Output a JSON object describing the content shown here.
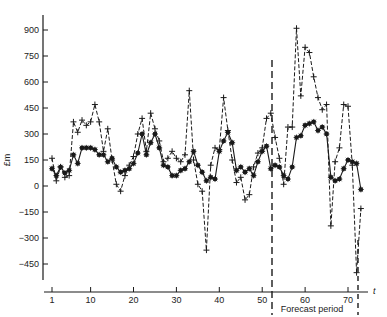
{
  "chart_data": {
    "type": "line",
    "title": "",
    "xlabel": "t",
    "ylabel": "£m",
    "ylim": [
      -520,
      960
    ],
    "xlim": [
      0,
      75
    ],
    "grid": false,
    "x_ticks": [
      1,
      10,
      20,
      30,
      40,
      50,
      60,
      70
    ],
    "y_ticks": [
      -450,
      -300,
      -150,
      0,
      150,
      300,
      450,
      600,
      750,
      900
    ],
    "annotations": [
      {
        "text": "Forecast period",
        "x": 62,
        "position": "below-axis"
      }
    ],
    "forecast_start": 53,
    "forecast_end": 73,
    "series": [
      {
        "name": "series-solid-asterisk",
        "marker": "*",
        "line": "solid",
        "x": [
          1,
          2,
          3,
          4,
          5,
          6,
          7,
          8,
          9,
          10,
          11,
          12,
          13,
          14,
          15,
          16,
          17,
          18,
          19,
          20,
          21,
          22,
          23,
          24,
          25,
          26,
          27,
          28,
          29,
          30,
          31,
          32,
          33,
          34,
          35,
          36,
          37,
          38,
          39,
          40,
          41,
          42,
          43,
          44,
          45,
          46,
          47,
          48,
          49,
          50,
          51,
          52,
          53,
          54,
          55,
          56,
          57,
          58,
          59,
          60,
          61,
          62,
          63,
          64,
          65,
          66,
          67,
          68,
          69,
          70,
          71,
          72,
          73
        ],
        "values": [
          100,
          60,
          110,
          75,
          90,
          180,
          130,
          220,
          220,
          220,
          210,
          180,
          180,
          140,
          160,
          110,
          80,
          90,
          100,
          130,
          190,
          300,
          180,
          250,
          300,
          220,
          120,
          110,
          60,
          60,
          90,
          100,
          140,
          200,
          120,
          80,
          30,
          50,
          40,
          200,
          260,
          310,
          250,
          90,
          110,
          80,
          100,
          60,
          140,
          200,
          230,
          100,
          120,
          110,
          60,
          40,
          110,
          280,
          290,
          350,
          360,
          370,
          320,
          340,
          300,
          50,
          30,
          40,
          100,
          150,
          140,
          130,
          -20
        ],
        "dashed_values_note": "solid line with asterisk markers"
      },
      {
        "name": "series-dashed-plus",
        "marker": "+",
        "line": "dashed",
        "x": [
          1,
          2,
          3,
          4,
          5,
          6,
          7,
          8,
          9,
          10,
          11,
          12,
          13,
          14,
          15,
          16,
          17,
          18,
          19,
          20,
          21,
          22,
          23,
          24,
          25,
          26,
          27,
          28,
          29,
          30,
          31,
          32,
          33,
          34,
          35,
          36,
          37,
          38,
          39,
          40,
          41,
          42,
          43,
          44,
          45,
          46,
          47,
          48,
          49,
          50,
          51,
          52,
          53,
          54,
          55,
          56,
          57,
          58,
          59,
          60,
          61,
          62,
          63,
          64,
          65,
          66,
          67,
          68,
          69,
          70,
          71,
          72,
          73
        ],
        "values": [
          160,
          30,
          110,
          50,
          60,
          370,
          310,
          380,
          350,
          370,
          470,
          370,
          200,
          330,
          150,
          10,
          -30,
          60,
          120,
          170,
          300,
          390,
          200,
          420,
          330,
          260,
          140,
          160,
          200,
          160,
          140,
          180,
          550,
          150,
          10,
          -30,
          -370,
          120,
          220,
          210,
          510,
          320,
          150,
          20,
          50,
          -80,
          -50,
          110,
          190,
          220,
          390,
          420,
          280,
          160,
          10,
          340,
          340,
          910,
          520,
          800,
          770,
          630,
          510,
          440,
          470,
          -230,
          140,
          220,
          470,
          460,
          120,
          -500,
          -130
        ]
      }
    ]
  }
}
